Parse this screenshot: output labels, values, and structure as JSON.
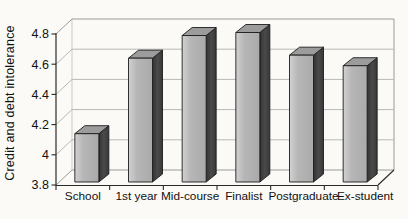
{
  "chart_data": {
    "type": "bar",
    "style": "3d-column",
    "title": "",
    "xlabel": "",
    "ylabel": "Credit and debt intolerance",
    "categories": [
      "School",
      "1st year",
      "Mid-course",
      "Finalist",
      "Postgraduate",
      "Ex-student"
    ],
    "values": [
      4.12,
      4.62,
      4.77,
      4.79,
      4.64,
      4.57
    ],
    "ylim": [
      3.8,
      4.8
    ],
    "yticks": [
      3.8,
      4.0,
      4.2,
      4.4,
      4.6,
      4.8
    ],
    "ytick_labels": [
      "3.8",
      "4",
      "4.2",
      "4.4",
      "4.6",
      "4.8"
    ],
    "grid": true,
    "legend": false
  },
  "colors": {
    "background": "#fbfaf7",
    "bar_front_light": "#d2d2d2",
    "bar_front": "#b2b2b2",
    "bar_top": "#9c9c9c",
    "bar_side": "#3f3f3f",
    "bar_outline": "#1c1c1c",
    "gridline": "#b8b8b6",
    "wall_edge": "#9a9a98",
    "wall_edge_light": "#c9c9c7",
    "axis": "#2a2a2a",
    "text": "#111111"
  }
}
